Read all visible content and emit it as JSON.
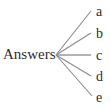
{
  "diagram": {
    "type": "fan-tree",
    "background_color": "#ffffff",
    "line_color": "#8a8a8a",
    "text_color": "#2e2e2e",
    "root": {
      "label": "Answers",
      "vertex": {
        "x": 56,
        "y": 55
      }
    },
    "branches": [
      {
        "label": "a",
        "end": {
          "x": 91,
          "y": 11
        },
        "label_x": 96,
        "label_y": 4
      },
      {
        "label": "b",
        "end": {
          "x": 91,
          "y": 33
        },
        "label_x": 96,
        "label_y": 26
      },
      {
        "label": "c",
        "end": {
          "x": 91,
          "y": 55
        },
        "label_x": 96,
        "label_y": 48
      },
      {
        "label": "d",
        "end": {
          "x": 91,
          "y": 76
        },
        "label_x": 96,
        "label_y": 69
      },
      {
        "label": "e",
        "end": {
          "x": 92,
          "y": 96
        },
        "label_x": 96,
        "label_y": 90
      }
    ]
  }
}
